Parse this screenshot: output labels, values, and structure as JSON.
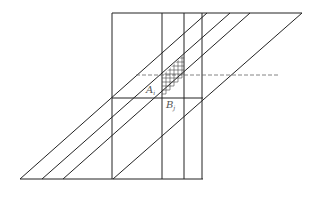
{
  "figure": {
    "labels": {
      "a": {
        "main": "A",
        "sub": "i"
      },
      "b": {
        "main": "B",
        "sub": "j"
      }
    },
    "colors": {
      "stroke": "#222222",
      "dashed": "#666666",
      "grid": "#444444",
      "label": "#555555"
    },
    "geometry": {
      "top_y": 13,
      "mid_y": 98,
      "bottom_y": 179,
      "dashed_y": 75,
      "verticals_x": [
        112,
        162,
        184,
        202
      ],
      "diagonal_top_x": [
        207,
        230,
        250,
        302
      ],
      "diagonal_bottom_x": [
        20,
        42,
        63,
        113
      ]
    }
  }
}
